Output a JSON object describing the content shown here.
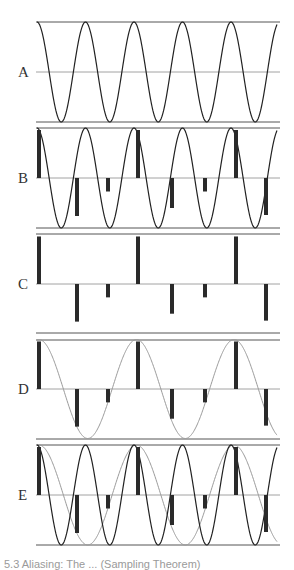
{
  "figure": {
    "caption": "5.3 Aliasing: The ... (Sampling Theorem)",
    "x_start": 37,
    "x_end": 277,
    "amplitude_px": 50,
    "colors": {
      "signal": "#222222",
      "alias": "#9a9a9a",
      "sample_bar": "#2a2a2a",
      "ref_line": "#555555",
      "mid_line": "#8a8a8a"
    },
    "signal": {
      "period_px": 48.5,
      "phase_x": 37,
      "label": "original high-frequency sinusoid"
    },
    "alias": {
      "period_px": 97.5,
      "phase_x": 39,
      "label": "aliased low-frequency sinusoid"
    },
    "samples": [
      {
        "x": 39,
        "value": 0.96
      },
      {
        "x": 77,
        "value": -0.76
      },
      {
        "x": 108,
        "value": -0.27
      },
      {
        "x": 138,
        "value": 0.96
      },
      {
        "x": 172,
        "value": -0.6
      },
      {
        "x": 205,
        "value": -0.27
      },
      {
        "x": 236,
        "value": 0.96
      },
      {
        "x": 266,
        "value": -0.74
      }
    ],
    "panels": [
      {
        "id": "A",
        "label": "A",
        "top": 22,
        "mid": 72,
        "bottom": 122,
        "show_signal": true,
        "show_samples": false,
        "show_alias": false
      },
      {
        "id": "B",
        "label": "B",
        "top": 128,
        "mid": 178,
        "bottom": 228,
        "show_signal": true,
        "show_samples": true,
        "show_alias": false
      },
      {
        "id": "C",
        "label": "C",
        "top": 234,
        "mid": 284,
        "bottom": 333,
        "show_signal": false,
        "show_samples": true,
        "show_alias": false
      },
      {
        "id": "D",
        "label": "D",
        "top": 340,
        "mid": 389,
        "bottom": 439,
        "show_signal": false,
        "show_samples": true,
        "show_alias": true
      },
      {
        "id": "E",
        "label": "E",
        "top": 445,
        "mid": 495,
        "bottom": 545,
        "show_signal": true,
        "show_samples": true,
        "show_alias": true
      }
    ]
  }
}
